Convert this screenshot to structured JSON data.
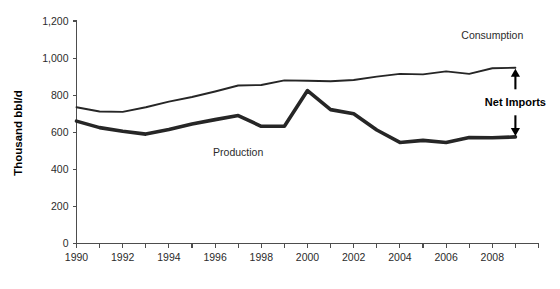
{
  "chart_data": {
    "type": "line",
    "title": "",
    "xlabel": "",
    "ylabel": "Thousand bbl/d",
    "x": [
      1990,
      1991,
      1992,
      1993,
      1994,
      1995,
      1996,
      1997,
      1998,
      1999,
      2000,
      2001,
      2002,
      2003,
      2004,
      2005,
      2006,
      2007,
      2008,
      2009
    ],
    "xlim": [
      1990,
      2010
    ],
    "ylim": [
      0,
      1200
    ],
    "grid": false,
    "legend_position": "inline-labels",
    "series": [
      {
        "name": "Consumption",
        "label_position": {
          "x": 2008,
          "y": 1105
        },
        "values": [
          735,
          712,
          710,
          735,
          765,
          790,
          820,
          852,
          855,
          880,
          878,
          875,
          882,
          900,
          915,
          912,
          928,
          915,
          945,
          948
        ]
      },
      {
        "name": "Production",
        "label_position": {
          "x": 1997,
          "y": 470
        },
        "values": [
          660,
          625,
          605,
          590,
          615,
          645,
          668,
          690,
          632,
          632,
          825,
          722,
          700,
          612,
          545,
          556,
          545,
          572,
          570,
          575
        ]
      }
    ],
    "annotations": [
      {
        "text": "Net Imports",
        "kind": "double-arrow-between-series",
        "at_x": 2009,
        "from_y": 575,
        "to_y": 948
      }
    ],
    "y_ticks": [
      "0",
      "200",
      "400",
      "600",
      "800",
      "1,000",
      "1,200"
    ],
    "y_tick_values": [
      0,
      200,
      400,
      600,
      800,
      1000,
      1200
    ],
    "x_ticks": [
      "1990",
      "1992",
      "1994",
      "1996",
      "1998",
      "2000",
      "2002",
      "2004",
      "2006",
      "2008"
    ],
    "x_tick_values": [
      1990,
      1992,
      1994,
      1996,
      1998,
      2000,
      2002,
      2004,
      2006,
      2008
    ],
    "x_minor_tick_values": [
      1990,
      1991,
      1992,
      1993,
      1994,
      1995,
      1996,
      1997,
      1998,
      1999,
      2000,
      2001,
      2002,
      2003,
      2004,
      2005,
      2006,
      2007,
      2008,
      2009,
      2010
    ],
    "colors": {
      "line": "#262626",
      "axis": "#4d4d4d",
      "text": "#2b2b2b",
      "background": "#ffffff"
    }
  }
}
